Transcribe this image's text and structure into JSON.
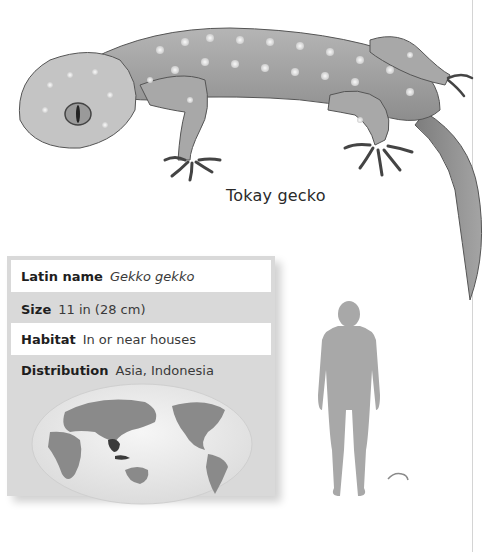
{
  "illustration": {
    "subject": "gecko-illustration",
    "caption": "Tokay gecko"
  },
  "fact_panel": {
    "rows": [
      {
        "label": "Latin name",
        "value": "Gekko gekko",
        "italic": true
      },
      {
        "label": "Size",
        "value": "11 in (28 cm)"
      },
      {
        "label": "Habitat",
        "value": "In or near houses"
      },
      {
        "label": "Distribution",
        "value": "Asia, Indonesia"
      }
    ],
    "map": {
      "icon": "world-map-icon",
      "highlighted_region": "Southeast Asia"
    }
  },
  "scale_comparison": {
    "human_icon": "human-silhouette-icon",
    "animal_icon": "gecko-scale-icon"
  },
  "colors": {
    "panel_bg": "#d9d9d9",
    "row_white": "#ffffff",
    "land": "#8a8a8a",
    "highlight": "#3a3a3a",
    "silhouette": "#a8a8a8"
  }
}
